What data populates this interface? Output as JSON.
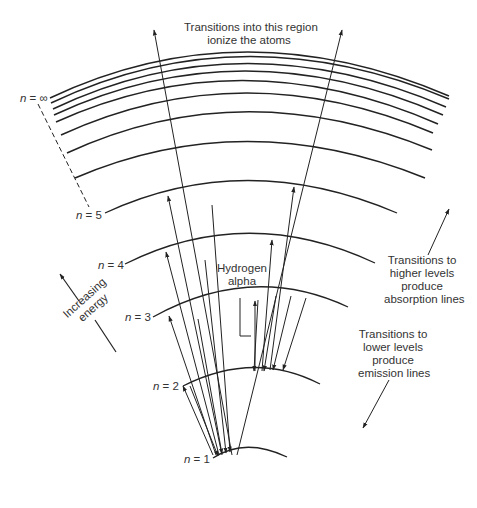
{
  "labels": {
    "ionize": [
      "Transitions into this region",
      "ionize the atoms"
    ],
    "hydrogen_alpha": [
      "Hydrogen",
      "alpha"
    ],
    "absorption": [
      "Transitions to",
      "higher levels",
      "produce",
      "absorption lines"
    ],
    "emission": [
      "Transitions to",
      "lower levels",
      "produce",
      "emission lines"
    ],
    "increasing_energy": [
      "Increasing",
      "energy"
    ]
  },
  "levels": [
    {
      "n": "1",
      "text": " = 1"
    },
    {
      "n": "2",
      "text": " = 2"
    },
    {
      "n": "3",
      "text": " = 3"
    },
    {
      "n": "4",
      "text": " = 4"
    },
    {
      "n": "5",
      "text": " = 5"
    },
    {
      "n": "inf",
      "text": " = ∞"
    }
  ],
  "n_symbol": "n",
  "colors": {
    "line": "#222222",
    "text": "#333333",
    "background": "#ffffff"
  }
}
